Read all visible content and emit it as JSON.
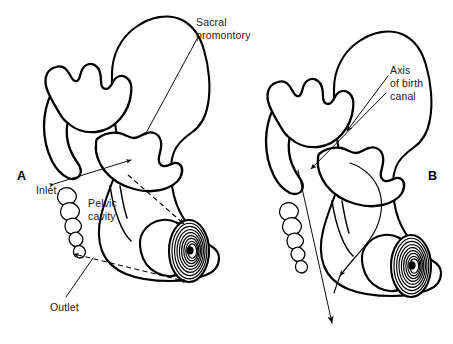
{
  "figure": {
    "type": "anatomical-line-diagram",
    "background_color": "#ffffff",
    "ink_color": "#000000",
    "style": "black-and-white pen-and-ink line art with stippled cancellous bone"
  },
  "panels": [
    {
      "id": "A",
      "letter": "A",
      "letter_position": {
        "x": 22,
        "y": 176
      },
      "description": "Left pelvis, sagittal section, annotated with pelvic planes"
    },
    {
      "id": "B",
      "letter": "B",
      "letter_position": {
        "x": 432,
        "y": 176
      },
      "description": "Right pelvis, sagittal section, annotated with birth canal axis"
    }
  ],
  "labels": [
    {
      "id": "sacral-promontory",
      "text_lines": [
        "Sacral",
        "promontory"
      ],
      "text": "Sacral promontory",
      "panel": "A",
      "anchor": {
        "x": 196,
        "y": 31
      },
      "leader_from": {
        "x": 198,
        "y": 38
      },
      "leader_to": {
        "x": 144,
        "y": 135
      },
      "has_arrowhead": false
    },
    {
      "id": "inlet",
      "text_lines": [
        "Inlet"
      ],
      "text": "Inlet",
      "panel": "A",
      "anchor": {
        "x": 41,
        "y": 190
      },
      "plane": "pelvic inlet",
      "line_style": "solid double-headed",
      "line_from": {
        "x": 54,
        "y": 184
      },
      "line_to": {
        "x": 131,
        "y": 160
      }
    },
    {
      "id": "pelvic-cavity",
      "text_lines": [
        "Pelvic",
        "cavity"
      ],
      "text": "Pelvic cavity",
      "panel": "A",
      "anchor": {
        "x": 92,
        "y": 205
      },
      "leader_from": {
        "x": 128,
        "y": 198
      },
      "leader_to": {
        "x": 183,
        "y": 223
      },
      "has_arrowhead": true
    },
    {
      "id": "outlet",
      "text_lines": [
        "Outlet"
      ],
      "text": "Outlet",
      "panel": "A",
      "anchor": {
        "x": 53,
        "y": 316
      },
      "plane": "pelvic outlet",
      "line_style": "dashed double-headed",
      "line_from": {
        "x": 72,
        "y": 253
      },
      "line_to": {
        "x": 180,
        "y": 280
      }
    },
    {
      "id": "axis-of-birth-canal",
      "text_lines": [
        "Axis",
        "of birth",
        "canal"
      ],
      "text": "Axis of birth canal",
      "panel": "B",
      "anchor": {
        "x": 392,
        "y": 72
      },
      "leader_1_from": {
        "x": 389,
        "y": 80
      },
      "leader_1_to": {
        "x": 345,
        "y": 130
      },
      "leader_2_from": {
        "x": 389,
        "y": 92
      },
      "leader_2_to": {
        "x": 309,
        "y": 170
      },
      "has_arrowhead": true,
      "exit_arrow_to": {
        "x": 333,
        "y": 325
      }
    }
  ],
  "anatomy_parts": [
    {
      "name": "ilium",
      "panels": [
        "A",
        "B"
      ],
      "shading": "outline"
    },
    {
      "name": "sacrum",
      "panels": [
        "A",
        "B"
      ],
      "shading": "stippled cancellous bone"
    },
    {
      "name": "coccyx",
      "panels": [
        "A",
        "B"
      ],
      "shading": "stippled segments"
    },
    {
      "name": "pubic symphysis",
      "panels": [
        "A",
        "B"
      ],
      "shading": "concentric spiral"
    },
    {
      "name": "obturator foramen",
      "panels": [
        "A",
        "B"
      ],
      "shading": "outline"
    },
    {
      "name": "ischium",
      "panels": [
        "A",
        "B"
      ],
      "shading": "outline"
    }
  ]
}
